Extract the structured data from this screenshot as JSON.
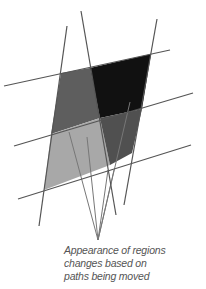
{
  "diagram": {
    "colors": {
      "background": "#ffffff",
      "line": "#555555",
      "callout_line": "#777777",
      "region_top_left": "#5e5e5e",
      "region_top_right": "#111111",
      "region_bottom_left": "#a8a8a8",
      "region_bottom_right": "#505050"
    },
    "regions": [
      {
        "name": "region-top-left",
        "points": "61,73 90,68 100,118 51,134",
        "fill": "#5e5e5e"
      },
      {
        "name": "region-top-right",
        "points": "90,68 151,54 142,109 100,118",
        "fill": "#111111"
      },
      {
        "name": "region-bottom-left",
        "points": "51,134 100,118 110,165 44,190",
        "fill": "#a8a8a8"
      },
      {
        "name": "region-bottom-right",
        "points": "100,118 142,109 132,153 110,165",
        "fill": "#505050"
      }
    ],
    "paths": [
      {
        "name": "horizontal-path-top",
        "x1": 4,
        "y1": 86,
        "x2": 170,
        "y2": 50
      },
      {
        "name": "horizontal-path-middle",
        "x1": 14,
        "y1": 146,
        "x2": 193,
        "y2": 93
      },
      {
        "name": "horizontal-path-bottom",
        "x1": 18,
        "y1": 199,
        "x2": 191,
        "y2": 145
      },
      {
        "name": "vertical-path-left",
        "x1": 67,
        "y1": 26,
        "x2": 39,
        "y2": 226
      },
      {
        "name": "vertical-path-middle",
        "x1": 81,
        "y1": 11,
        "x2": 116,
        "y2": 215
      },
      {
        "name": "vertical-path-right",
        "x1": 157,
        "y1": 19,
        "x2": 124,
        "y2": 205
      }
    ],
    "callouts": [
      {
        "name": "callout-line-1",
        "x1": 98,
        "y1": 240,
        "x2": 69,
        "y2": 132
      },
      {
        "name": "callout-line-2",
        "x1": 98,
        "y1": 240,
        "x2": 87,
        "y2": 137
      },
      {
        "name": "callout-line-3",
        "x1": 98,
        "y1": 240,
        "x2": 108,
        "y2": 170
      },
      {
        "name": "callout-line-4",
        "x1": 98,
        "y1": 240,
        "x2": 114,
        "y2": 170
      },
      {
        "name": "callout-line-5",
        "x1": 98,
        "y1": 240,
        "x2": 130,
        "y2": 102
      }
    ],
    "caption": {
      "line1": "Appearance of regions",
      "line2": "changes based on",
      "line3": "paths being moved"
    }
  }
}
